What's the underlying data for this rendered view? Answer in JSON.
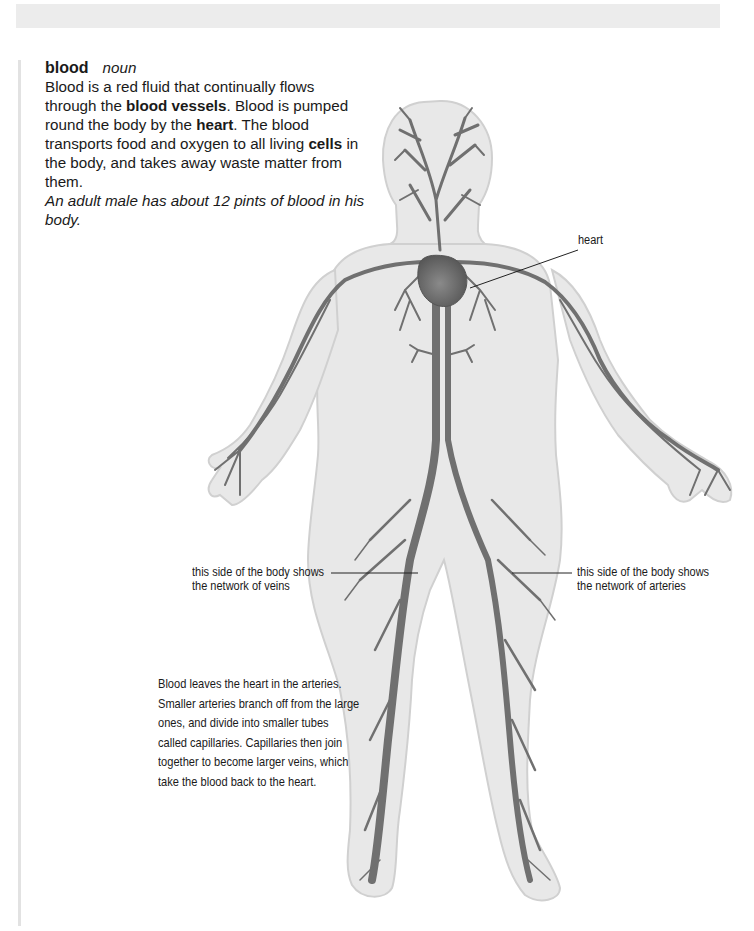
{
  "entry": {
    "headword": "blood",
    "part_of_speech": "noun",
    "definition": {
      "t1": "Blood is a red fluid that continually flows through the ",
      "b1": "blood vessels",
      "t2": ". Blood is pumped round the body by the ",
      "b2": "heart",
      "t3": ". The blood transports food and oxygen to all living ",
      "b3": "cells",
      "t4": " in the body, and takes away waste matter from them."
    },
    "example": "An adult male has about 12 pints of blood in his body."
  },
  "illustration": {
    "subject": "human-circulatory-system",
    "colors": {
      "skin": "#e6e6e6",
      "skin_edge": "#cfcfcf",
      "vessel": "#6e6e6e",
      "heart": "#5f5f5f"
    },
    "labels": {
      "heart": "heart",
      "veins": [
        "this side of the body shows",
        "the network of veins"
      ],
      "arteries": [
        "this side of the body shows",
        "the network of arteries"
      ]
    }
  },
  "caption": {
    "lines": [
      "Blood leaves the heart in the arteries.",
      "Smaller arteries branch off from the large",
      "ones, and divide into smaller tubes",
      "called capillaries. Capillaries then join",
      "together to become larger veins, which",
      "take the blood back to the heart."
    ]
  }
}
